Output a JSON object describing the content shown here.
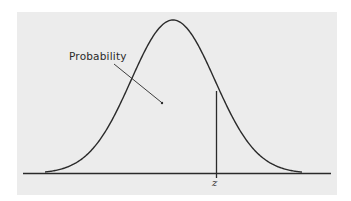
{
  "diagram": {
    "type": "normal-distribution",
    "background": "#ececec",
    "line_color": "#2a2a2a",
    "annotation_label": "Probability",
    "z_label": "z"
  },
  "chart_data": {
    "type": "area",
    "title": "",
    "xlabel": "",
    "ylabel": "",
    "curve": "standard normal density",
    "marker": {
      "label": "z",
      "description": "vertical line at z, right of mean"
    },
    "annotations": [
      {
        "text": "Probability",
        "points_to": "area under curve left of z"
      }
    ],
    "grid": false,
    "legend": null
  }
}
